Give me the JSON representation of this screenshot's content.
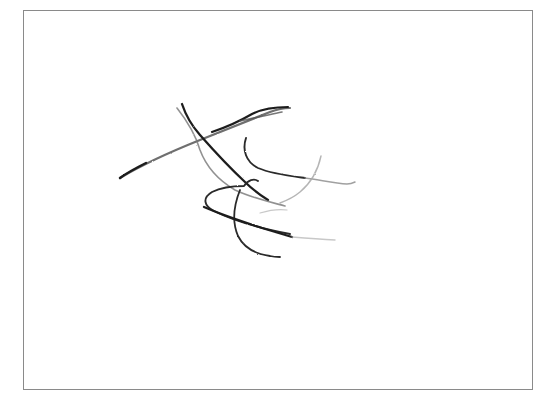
{
  "image": {
    "description": "Pencil scribble sketch inside a thin rectangular frame",
    "background_color": "#ffffff",
    "frame": {
      "color": "#8a8a8a"
    },
    "sketch": {
      "stroke_color_dark": "#1e1e1e",
      "stroke_color_mid": "#555555",
      "stroke_color_light": "#a8a8a8",
      "stroke_count": 9
    }
  }
}
